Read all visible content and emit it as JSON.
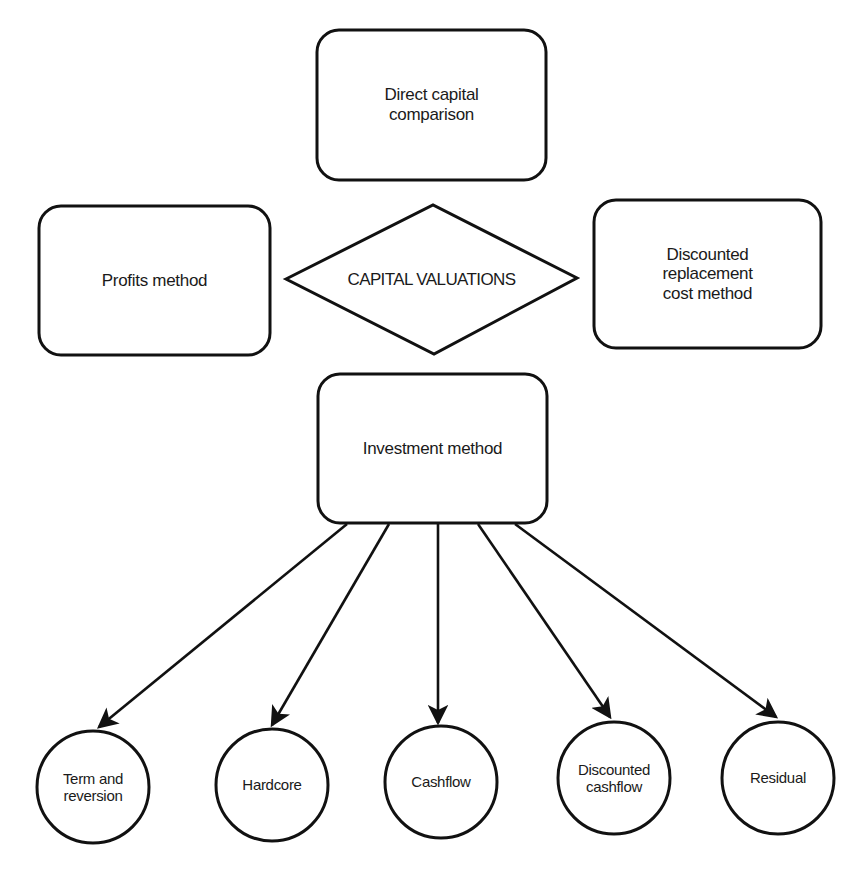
{
  "diagram": {
    "center": {
      "label": "CAPITAL VALUATIONS",
      "shape": "diamond"
    },
    "methods": [
      {
        "id": "direct",
        "label_lines": [
          "Direct capital",
          "comparison"
        ],
        "shape": "rounded-rect",
        "position": "top"
      },
      {
        "id": "profits",
        "label_lines": [
          "Profits method"
        ],
        "shape": "rounded-rect",
        "position": "left"
      },
      {
        "id": "drc",
        "label_lines": [
          "Discounted",
          "replacement",
          "cost method"
        ],
        "shape": "rounded-rect",
        "position": "right"
      },
      {
        "id": "investment",
        "label_lines": [
          "Investment method"
        ],
        "shape": "rounded-rect",
        "position": "bottom"
      }
    ],
    "investment_submethods": [
      {
        "id": "term",
        "label_lines": [
          "Term and",
          "reversion"
        ]
      },
      {
        "id": "hardcore",
        "label_lines": [
          "Hardcore"
        ]
      },
      {
        "id": "cashflow",
        "label_lines": [
          "Cashflow"
        ]
      },
      {
        "id": "dcf",
        "label_lines": [
          "Discounted",
          "cashflow"
        ]
      },
      {
        "id": "residual",
        "label_lines": [
          "Residual"
        ]
      }
    ],
    "edges": [
      {
        "from": "investment",
        "to": "term"
      },
      {
        "from": "investment",
        "to": "hardcore"
      },
      {
        "from": "investment",
        "to": "cashflow"
      },
      {
        "from": "investment",
        "to": "dcf"
      },
      {
        "from": "investment",
        "to": "residual"
      }
    ],
    "colors": {
      "stroke": "#111111",
      "background": "#ffffff",
      "text": "#1a1a1a"
    }
  }
}
